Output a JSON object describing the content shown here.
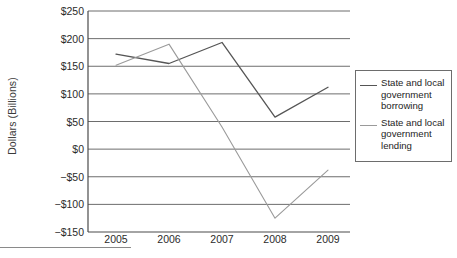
{
  "chart_data": {
    "type": "line",
    "title": "",
    "xlabel": "",
    "ylabel": "Dollars (Billions)",
    "categories": [
      "2005",
      "2006",
      "2007",
      "2008",
      "2009"
    ],
    "x": [
      2005,
      2006,
      2007,
      2008,
      2009
    ],
    "series": [
      {
        "name": "State and local government borrowing",
        "color": "#555555",
        "values": [
          172,
          155,
          193,
          58,
          112
        ]
      },
      {
        "name": "State and local government lending",
        "color": "#9a9a9a",
        "values": [
          152,
          190,
          40,
          -125,
          -38
        ]
      }
    ],
    "ylim": [
      -150,
      250
    ],
    "ytick_values": [
      250,
      200,
      150,
      100,
      50,
      0,
      -50,
      -100,
      -150
    ],
    "ytick_labels": [
      "$250",
      "$200",
      "$150",
      "$100",
      "$50",
      "$0",
      "−$50",
      "−$100",
      "−$150"
    ],
    "grid": true,
    "grid_axis": "y",
    "legend_position": "right",
    "legend_entries": [
      "State and local government borrowing",
      "State and local government lending"
    ]
  },
  "legend": {
    "items": [
      {
        "label": "State and local government borrowing"
      },
      {
        "label": "State and local government lending"
      }
    ]
  },
  "colors": {
    "borrowing_line": "#555555",
    "lending_line": "#9a9a9a",
    "grid": "#6d6d6d",
    "axis": "#4a4a4a",
    "text": "#2b2b2b"
  }
}
